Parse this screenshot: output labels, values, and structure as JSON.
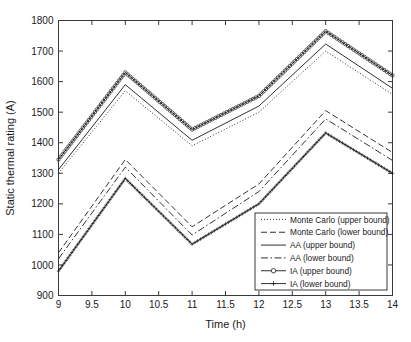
{
  "chart_data": {
    "type": "line",
    "title": "",
    "xlabel": "Time (h)",
    "ylabel": "Static thermal rating (A)",
    "xlim": [
      9,
      14
    ],
    "ylim": [
      900,
      1800
    ],
    "grid": false,
    "legend_position": "bottom-right",
    "xticks": [
      "9",
      "9.5",
      "10",
      "10.5",
      "11",
      "11.5",
      "12",
      "12.5",
      "13",
      "13.5",
      "14"
    ],
    "xtick_values": [
      9,
      9.5,
      10,
      10.5,
      11,
      11.5,
      12,
      12.5,
      13,
      13.5,
      14
    ],
    "yticks": [
      "900",
      "1000",
      "1100",
      "1200",
      "1300",
      "1400",
      "1500",
      "1600",
      "1700",
      "1800"
    ],
    "ytick_values": [
      900,
      1000,
      1100,
      1200,
      1300,
      1400,
      1500,
      1600,
      1700,
      1800
    ],
    "x": [
      9,
      10,
      11,
      12,
      13,
      14
    ],
    "series": [
      {
        "name": "Monte Carlo (upper bound)",
        "style": "dotted",
        "marker": "none",
        "color": "#1a1a1a",
        "values": [
          1300,
          1570,
          1390,
          1500,
          1700,
          1558
        ]
      },
      {
        "name": "Monte Carlo (lower bound)",
        "style": "dashed",
        "marker": "none",
        "color": "#1a1a1a",
        "values": [
          1040,
          1345,
          1125,
          1265,
          1505,
          1368
        ]
      },
      {
        "name": "AA (upper bound)",
        "style": "solid",
        "marker": "none",
        "color": "#1a1a1a",
        "values": [
          1312,
          1590,
          1408,
          1520,
          1723,
          1578
        ]
      },
      {
        "name": "AA (lower bound)",
        "style": "dashdot",
        "marker": "none",
        "color": "#1a1a1a",
        "values": [
          1020,
          1320,
          1098,
          1240,
          1478,
          1342
        ]
      },
      {
        "name": "IA (upper bound)",
        "style": "solid",
        "marker": "circle",
        "color": "#1a1a1a",
        "values": [
          1345,
          1630,
          1443,
          1553,
          1765,
          1620
        ]
      },
      {
        "name": "IA (lower bound)",
        "style": "solid",
        "marker": "plus",
        "color": "#1a1a1a",
        "values": [
          980,
          1283,
          1068,
          1200,
          1432,
          1300
        ]
      }
    ]
  }
}
